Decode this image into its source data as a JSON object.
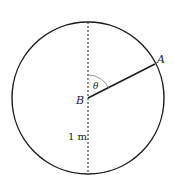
{
  "diagram": {
    "points": {
      "A": {
        "label": "A"
      },
      "B": {
        "label": "B"
      }
    },
    "angle": {
      "label": "θ"
    },
    "length": {
      "label": "1 m"
    },
    "colors": {
      "stroke": "#1a1a1a",
      "arc": "#888888",
      "background": "#ffffff"
    }
  }
}
